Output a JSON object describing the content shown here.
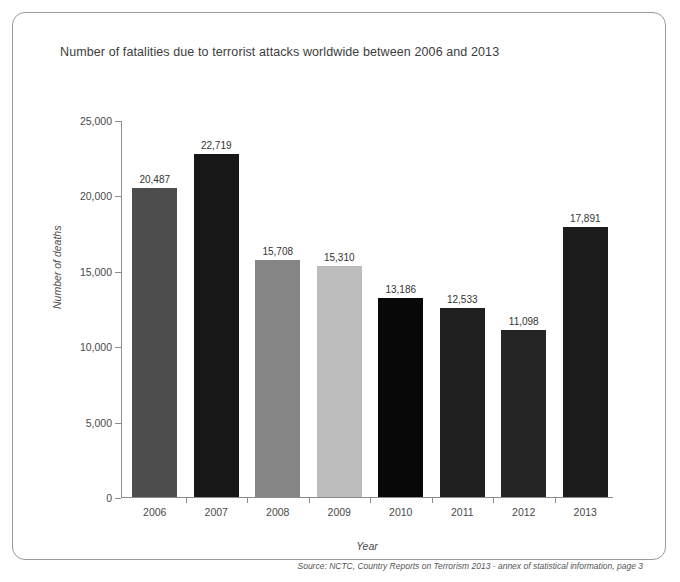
{
  "card": {
    "title": "Number of fatalities due to terrorist attacks worldwide between 2006 and 2013",
    "source": "Source: NCTC, Country Reports on Terrorism 2013 - annex of statistical information, page 3"
  },
  "chart_data": {
    "type": "bar",
    "title": "Number of fatalities due to terrorist attacks worldwide between 2006 and 2013",
    "xlabel": "Year",
    "ylabel": "Number of deaths",
    "categories": [
      "2006",
      "2007",
      "2008",
      "2009",
      "2010",
      "2011",
      "2012",
      "2013"
    ],
    "values": [
      20487,
      22719,
      15708,
      15310,
      13186,
      12533,
      11098,
      17891
    ],
    "value_labels": [
      "20,487",
      "22,719",
      "15,708",
      "15,310",
      "13,186",
      "12,533",
      "11,098",
      "17,891"
    ],
    "bar_colors": [
      "#4d4d4d",
      "#171717",
      "#858585",
      "#bcbcbc",
      "#080808",
      "#1f1f1f",
      "#252525",
      "#1c1c1c"
    ],
    "ylim": [
      0,
      25000
    ],
    "yticks": [
      0,
      5000,
      10000,
      15000,
      20000,
      25000
    ],
    "ytick_labels": [
      "0",
      "5,000",
      "10,000",
      "15,000",
      "20,000",
      "25,000"
    ],
    "grid": false,
    "legend": "none"
  }
}
